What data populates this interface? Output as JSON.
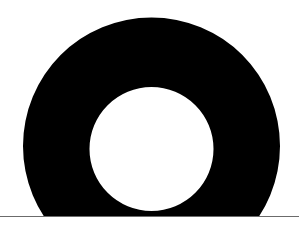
{
  "scene": {
    "shape": "ring",
    "ring_color": "#000000",
    "background_color": "#ffffff",
    "baseline_color": "#6b6b6b",
    "outer_circle": {
      "cx": 151.5,
      "cy": 146,
      "r": 128.5
    },
    "inner_circle": {
      "cx": 151.5,
      "cy": 149,
      "r": 62
    },
    "baseline_y": 216
  }
}
